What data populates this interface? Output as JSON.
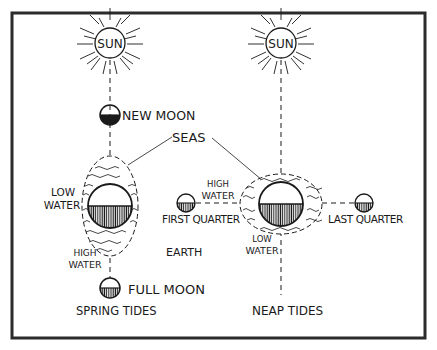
{
  "diagram": {
    "type": "tides",
    "colors": {
      "ink": "#1a1a1a",
      "paper": "#ffffff",
      "frame": "#2b2b2b"
    },
    "left_panel": {
      "sun_label": "SUN",
      "new_moon_label": "NEW MOON",
      "full_moon_label": "FULL MOON",
      "low_water_line1": "LOW",
      "low_water_line2": "WATER",
      "high_water_line1": "HIGH",
      "high_water_line2": "WATER",
      "caption": "SPRING TIDES"
    },
    "right_panel": {
      "sun_label": "SUN",
      "first_quarter_label": "FIRST QUARTER",
      "last_quarter_label": "LAST QUARTER",
      "high_water_line1": "HIGH",
      "high_water_line2": "WATER",
      "low_water_line1": "LOW",
      "low_water_line2": "WATER",
      "caption": "NEAP TIDES"
    },
    "shared": {
      "seas_label": "SEAS",
      "earth_label": "EARTH"
    }
  }
}
